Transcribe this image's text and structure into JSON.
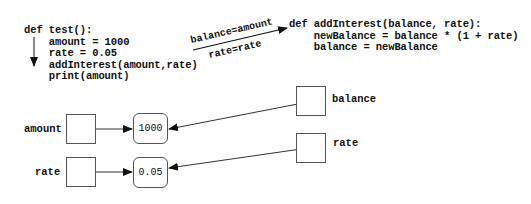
{
  "caller": {
    "lines": [
      "def test():",
      "    amount = 1000",
      "    rate = 0.05",
      "    addInterest(amount,rate)",
      "    print(amount)"
    ]
  },
  "callee": {
    "lines": [
      "def addInterest(balance, rate):",
      "    newBalance = balance * (1 + rate)",
      "    balance = newBalance"
    ]
  },
  "parameter_passing": {
    "top_label": "balance=amount",
    "bottom_label": "rate=rate"
  },
  "caller_variables": [
    {
      "name": "amount",
      "value": "1000"
    },
    {
      "name": "rate",
      "value": "0.05"
    }
  ],
  "callee_variables": [
    {
      "name": "balance"
    },
    {
      "name": "rate"
    }
  ],
  "colors": {
    "ink": "#111111",
    "border": "#555555",
    "background": "#ffffff"
  }
}
